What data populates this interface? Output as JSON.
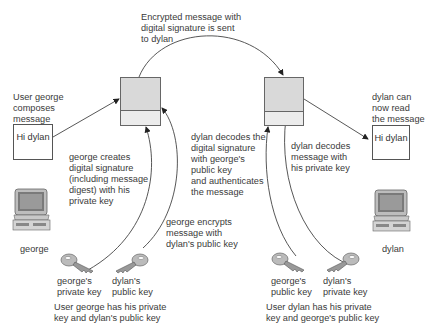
{
  "top": {
    "caption": [
      "Encrypted message with",
      "digital signature is sent",
      "to dylan"
    ]
  },
  "george": {
    "compose_label": [
      "User george",
      "composes",
      "message"
    ],
    "message_box": "Hi dylan",
    "sign_label": [
      "george creates",
      "digital signature",
      "(including message",
      "digest) with his",
      "private key"
    ],
    "encrypt_label": [
      "george encrypts",
      "message with",
      "dylan's public key"
    ],
    "computer_label": "george",
    "keys": [
      {
        "label": [
          "george's",
          "private key"
        ],
        "icon": "key-icon"
      },
      {
        "label": [
          "dylan's",
          "public key"
        ],
        "icon": "key-icon"
      }
    ],
    "summary": [
      "User george has his private",
      "key and dylan's public key"
    ]
  },
  "dylan": {
    "verify_label": [
      "dylan decodes the",
      "digital signature",
      "with george's",
      "public key",
      "and authenticates",
      "the message"
    ],
    "decode_label": [
      "dylan decodes",
      "message with",
      "his private key"
    ],
    "read_label": [
      "dylan can",
      "now read",
      "the message"
    ],
    "message_box": "Hi dylan",
    "computer_label": "dylan",
    "keys": [
      {
        "label": [
          "george's",
          "public key"
        ],
        "icon": "key-icon"
      },
      {
        "label": [
          "dylan's",
          "private key"
        ],
        "icon": "key-icon"
      }
    ],
    "summary": [
      "User dylan has his private",
      "key and george's public key"
    ]
  },
  "colors": {
    "line": "#444444",
    "envelope_top": "#d9d9d9",
    "envelope_bottom": "#ececec",
    "text": "#3a3a3a"
  }
}
